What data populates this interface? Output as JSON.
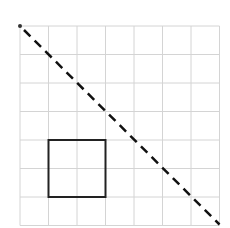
{
  "diagram": {
    "type": "grid-figure",
    "grid": {
      "rows": 7,
      "cols": 7,
      "origin_x": 20,
      "origin_y": 26,
      "cell_size": 28.5,
      "line_color": "#d4d4d4"
    },
    "square": {
      "col_start": 1,
      "row_start": 4,
      "cols_span": 2,
      "rows_span": 2,
      "stroke_color": "#222222"
    },
    "diagonal": {
      "style": "dashed",
      "from": "top-left corner",
      "to": "bottom-right corner",
      "stroke_color": "#111111"
    },
    "start_dot": {
      "position": "top-left corner",
      "color": "#333333"
    }
  }
}
